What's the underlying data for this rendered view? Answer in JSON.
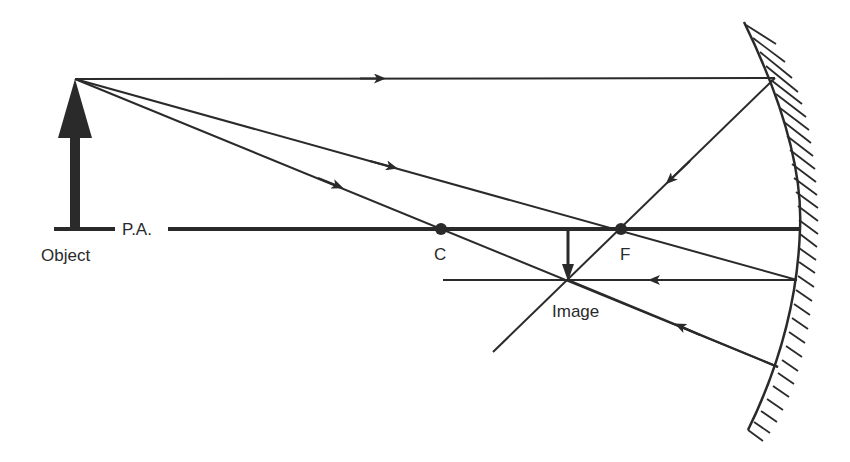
{
  "diagram": {
    "type": "concave-mirror-ray-diagram",
    "colors": {
      "ink": "#2a2a2a",
      "background": "#ffffff"
    },
    "labels": {
      "object": "Object",
      "principal_axis": "P.A.",
      "center_of_curvature": "C",
      "focal_point": "F",
      "image": "Image"
    },
    "points": {
      "object_base": [
        75,
        229
      ],
      "object_tip": [
        75,
        79
      ],
      "C": [
        441,
        229
      ],
      "F": [
        621,
        229
      ],
      "image_base": [
        568,
        229
      ],
      "image_tip": [
        568,
        280
      ],
      "mirror_top": [
        744,
        22
      ],
      "mirror_vertex": [
        800,
        229
      ],
      "mirror_bottom": [
        748,
        430
      ]
    },
    "rays": [
      {
        "name": "parallel-ray-incident",
        "from": [
          75,
          79
        ],
        "to": [
          775,
          78
        ]
      },
      {
        "name": "parallel-ray-reflected",
        "from": [
          775,
          78
        ],
        "to": [
          493,
          352
        ]
      },
      {
        "name": "focal-ray-incident",
        "from": [
          75,
          79
        ],
        "to": [
          797,
          280
        ]
      },
      {
        "name": "focal-ray-reflected",
        "from": [
          797,
          280
        ],
        "to": [
          443,
          280
        ]
      },
      {
        "name": "center-ray-incident",
        "from": [
          75,
          79
        ],
        "to": [
          778,
          367
        ]
      },
      {
        "name": "center-ray-reflected",
        "from": [
          778,
          367
        ],
        "to": [
          568,
          280
        ]
      }
    ]
  }
}
